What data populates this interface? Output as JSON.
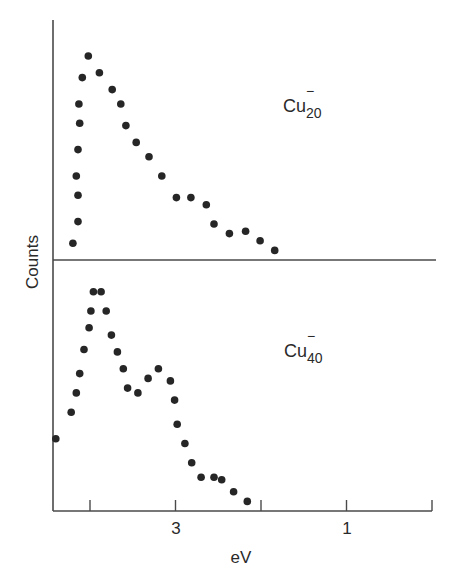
{
  "chart_data": {
    "type": "scatter",
    "title": "",
    "xlabel": "eV",
    "ylabel": "Counts",
    "x_reversed": true,
    "xlim": [
      4.45,
      0
    ],
    "x_ticks": [
      4,
      3,
      2,
      1,
      0
    ],
    "x_tick_labels": [
      {
        "value": 3,
        "label": "3"
      },
      {
        "value": 1,
        "label": "1"
      }
    ],
    "y_ticks": [],
    "grid": false,
    "legend": "none",
    "panels": [
      {
        "name": "Cu20-",
        "label_base": "Cu",
        "label_sub": "20",
        "label_sup": "−",
        "ylim": [
          0,
          1
        ],
        "y_units": "normalized counts (arbitrary)",
        "points": [
          {
            "ev": 4.2,
            "counts": 0.07
          },
          {
            "ev": 4.14,
            "counts": 0.16
          },
          {
            "ev": 4.14,
            "counts": 0.27
          },
          {
            "ev": 4.16,
            "counts": 0.35
          },
          {
            "ev": 4.14,
            "counts": 0.46
          },
          {
            "ev": 4.12,
            "counts": 0.57
          },
          {
            "ev": 4.13,
            "counts": 0.65
          },
          {
            "ev": 4.09,
            "counts": 0.76
          },
          {
            "ev": 4.02,
            "counts": 0.85
          },
          {
            "ev": 3.89,
            "counts": 0.78
          },
          {
            "ev": 3.74,
            "counts": 0.71
          },
          {
            "ev": 3.64,
            "counts": 0.65
          },
          {
            "ev": 3.58,
            "counts": 0.56
          },
          {
            "ev": 3.46,
            "counts": 0.49
          },
          {
            "ev": 3.31,
            "counts": 0.43
          },
          {
            "ev": 3.16,
            "counts": 0.35
          },
          {
            "ev": 2.99,
            "counts": 0.26
          },
          {
            "ev": 2.82,
            "counts": 0.26
          },
          {
            "ev": 2.64,
            "counts": 0.23
          },
          {
            "ev": 2.55,
            "counts": 0.15
          },
          {
            "ev": 2.37,
            "counts": 0.11
          },
          {
            "ev": 2.18,
            "counts": 0.12
          },
          {
            "ev": 2.01,
            "counts": 0.08
          },
          {
            "ev": 1.84,
            "counts": 0.04
          }
        ]
      },
      {
        "name": "Cu40-",
        "label_base": "Cu",
        "label_sub": "40",
        "label_sup": "−",
        "ylim": [
          0,
          1
        ],
        "y_units": "normalized counts (arbitrary)",
        "points": [
          {
            "ev": 4.4,
            "counts": 0.3
          },
          {
            "ev": 4.22,
            "counts": 0.41
          },
          {
            "ev": 4.16,
            "counts": 0.49
          },
          {
            "ev": 4.12,
            "counts": 0.57
          },
          {
            "ev": 4.07,
            "counts": 0.67
          },
          {
            "ev": 4.01,
            "counts": 0.76
          },
          {
            "ev": 3.99,
            "counts": 0.83
          },
          {
            "ev": 3.96,
            "counts": 0.91
          },
          {
            "ev": 3.87,
            "counts": 0.91
          },
          {
            "ev": 3.81,
            "counts": 0.83
          },
          {
            "ev": 3.75,
            "counts": 0.73
          },
          {
            "ev": 3.68,
            "counts": 0.66
          },
          {
            "ev": 3.61,
            "counts": 0.59
          },
          {
            "ev": 3.56,
            "counts": 0.51
          },
          {
            "ev": 3.44,
            "counts": 0.49
          },
          {
            "ev": 3.32,
            "counts": 0.55
          },
          {
            "ev": 3.2,
            "counts": 0.59
          },
          {
            "ev": 3.06,
            "counts": 0.54
          },
          {
            "ev": 3.01,
            "counts": 0.46
          },
          {
            "ev": 2.98,
            "counts": 0.36
          },
          {
            "ev": 2.89,
            "counts": 0.28
          },
          {
            "ev": 2.81,
            "counts": 0.2
          },
          {
            "ev": 2.7,
            "counts": 0.14
          },
          {
            "ev": 2.55,
            "counts": 0.14
          },
          {
            "ev": 2.46,
            "counts": 0.13
          },
          {
            "ev": 2.32,
            "counts": 0.08
          },
          {
            "ev": 2.16,
            "counts": 0.04
          }
        ]
      }
    ]
  },
  "labels": {
    "ylabel": "Counts",
    "xlabel": "eV",
    "tick_3": "3",
    "tick_1": "1",
    "panel_top_base": "Cu",
    "panel_top_sub": "20",
    "panel_top_sup": "−",
    "panel_bottom_base": "Cu",
    "panel_bottom_sub": "40",
    "panel_bottom_sup": "−"
  },
  "colors": {
    "axis": "#4a4a4a",
    "dot": "#262626",
    "background": "#ffffff"
  }
}
